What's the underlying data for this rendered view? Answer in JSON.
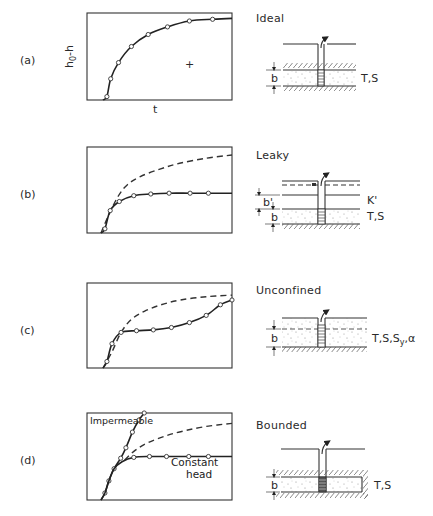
{
  "figure": {
    "panels": [
      {
        "id": "a",
        "label": "(a)",
        "title": "Ideal",
        "params": "T,S",
        "thickness_label": "b",
        "y_axis_label": "h0-h",
        "y_axis_label_base": "h",
        "y_axis_label_sub": "0",
        "y_axis_label_rest": "-h",
        "x_axis_label": "t",
        "marker": "+",
        "curves": [
          {
            "name": "ideal",
            "style": "solid",
            "markers": true,
            "points": [
              [
                0.0,
                0.0
              ],
              [
                0.03,
                0.04
              ],
              [
                0.06,
                0.25
              ],
              [
                0.12,
                0.44
              ],
              [
                0.22,
                0.63
              ],
              [
                0.35,
                0.77
              ],
              [
                0.5,
                0.86
              ],
              [
                0.67,
                0.93
              ],
              [
                0.85,
                0.95
              ],
              [
                1.0,
                0.96
              ]
            ],
            "marker_x": [
              0.03,
              0.06,
              0.12,
              0.22,
              0.35,
              0.5,
              0.67,
              0.85
            ]
          }
        ]
      },
      {
        "id": "b",
        "label": "(b)",
        "title": "Leaky",
        "params": "T,S",
        "aquitard_param": "K'",
        "thickness_label": "b",
        "aquitard_thickness_label": "b'",
        "curves": [
          {
            "name": "theis-reference",
            "style": "dashed",
            "markers": false,
            "points": [
              [
                0.0,
                0.0
              ],
              [
                0.06,
                0.22
              ],
              [
                0.13,
                0.44
              ],
              [
                0.2,
                0.58
              ],
              [
                0.3,
                0.68
              ],
              [
                0.45,
                0.77
              ],
              [
                0.6,
                0.84
              ],
              [
                0.8,
                0.9
              ],
              [
                1.0,
                0.94
              ]
            ]
          },
          {
            "name": "leaky",
            "style": "solid",
            "markers": true,
            "points": [
              [
                0.0,
                0.0
              ],
              [
                0.03,
                0.05
              ],
              [
                0.07,
                0.27
              ],
              [
                0.14,
                0.38
              ],
              [
                0.25,
                0.45
              ],
              [
                0.38,
                0.47
              ],
              [
                0.52,
                0.48
              ],
              [
                0.68,
                0.48
              ],
              [
                0.82,
                0.48
              ],
              [
                1.0,
                0.48
              ]
            ],
            "marker_x": [
              0.03,
              0.07,
              0.14,
              0.25,
              0.38,
              0.52,
              0.68,
              0.82
            ]
          }
        ]
      },
      {
        "id": "c",
        "label": "(c)",
        "title": "Unconfined",
        "params": "T,S,Sy,α",
        "params_base": "T,S,S",
        "params_sub": "y",
        "params_tail": ",α",
        "thickness_label": "b",
        "curves": [
          {
            "name": "theis-reference",
            "style": "dashed",
            "markers": false,
            "points": [
              [
                0.0,
                0.0
              ],
              [
                0.07,
                0.2
              ],
              [
                0.14,
                0.44
              ],
              [
                0.22,
                0.6
              ],
              [
                0.32,
                0.7
              ],
              [
                0.45,
                0.78
              ],
              [
                0.6,
                0.84
              ],
              [
                0.8,
                0.88
              ],
              [
                1.0,
                0.9
              ]
            ]
          },
          {
            "name": "unconfined",
            "style": "solid",
            "markers": true,
            "points": [
              [
                0.0,
                0.0
              ],
              [
                0.03,
                0.08
              ],
              [
                0.07,
                0.3
              ],
              [
                0.14,
                0.44
              ],
              [
                0.26,
                0.46
              ],
              [
                0.39,
                0.47
              ],
              [
                0.53,
                0.5
              ],
              [
                0.67,
                0.56
              ],
              [
                0.8,
                0.65
              ],
              [
                0.91,
                0.78
              ],
              [
                1.0,
                0.84
              ]
            ],
            "marker_x": [
              0.03,
              0.07,
              0.14,
              0.26,
              0.39,
              0.53,
              0.67,
              0.8,
              0.91,
              1.0
            ]
          }
        ]
      },
      {
        "id": "d",
        "label": "(d)",
        "title": "Bounded",
        "params": "T,S",
        "thickness_label": "b",
        "annotations": [
          "Impermeable",
          "Constant",
          "head"
        ],
        "curves": [
          {
            "name": "theis-reference",
            "style": "dashed",
            "markers": false,
            "points": [
              [
                0.18,
                0.46
              ],
              [
                0.26,
                0.57
              ],
              [
                0.36,
                0.66
              ],
              [
                0.5,
                0.74
              ],
              [
                0.65,
                0.8
              ],
              [
                0.82,
                0.85
              ],
              [
                1.0,
                0.88
              ]
            ]
          },
          {
            "name": "impermeable",
            "style": "solid",
            "markers": true,
            "points": [
              [
                0.0,
                0.0
              ],
              [
                0.03,
                0.08
              ],
              [
                0.06,
                0.22
              ],
              [
                0.1,
                0.36
              ],
              [
                0.15,
                0.48
              ],
              [
                0.19,
                0.6
              ],
              [
                0.24,
                0.78
              ],
              [
                0.29,
                0.92
              ],
              [
                0.33,
                1.0
              ]
            ],
            "marker_x": [
              0.03,
              0.06,
              0.1,
              0.15,
              0.19,
              0.24,
              0.29,
              0.33
            ]
          },
          {
            "name": "constant-head",
            "style": "solid",
            "markers": true,
            "points": [
              [
                0.0,
                0.0
              ],
              [
                0.03,
                0.08
              ],
              [
                0.06,
                0.22
              ],
              [
                0.1,
                0.36
              ],
              [
                0.16,
                0.44
              ],
              [
                0.25,
                0.49
              ],
              [
                0.37,
                0.5
              ],
              [
                0.5,
                0.5
              ],
              [
                0.67,
                0.5
              ],
              [
                0.82,
                0.5
              ],
              [
                1.0,
                0.5
              ]
            ],
            "marker_x": [
              0.25,
              0.37,
              0.5,
              0.67,
              0.82
            ]
          }
        ]
      }
    ]
  }
}
